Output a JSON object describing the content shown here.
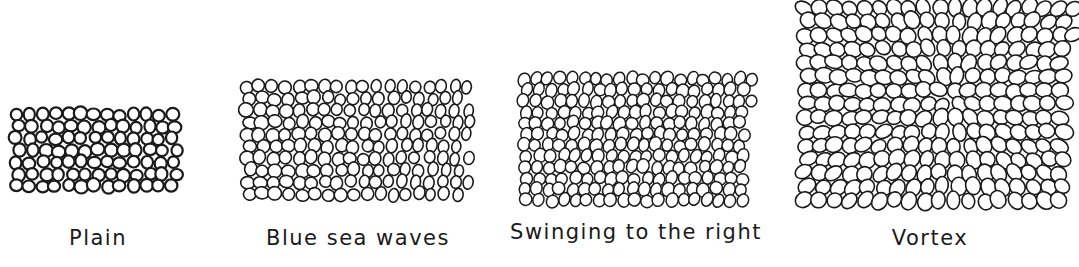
{
  "figure": {
    "panels": [
      {
        "id": "plain",
        "label": "Plain",
        "box": {
          "x": 10,
          "y": 108,
          "w": 175,
          "h": 88
        },
        "label_x": 98,
        "label_y": 226,
        "cell": 13,
        "stroke": 2.2,
        "style": "plain"
      },
      {
        "id": "blue-sea-waves",
        "label": "Blue sea waves",
        "box": {
          "x": 240,
          "y": 80,
          "w": 235,
          "h": 118
        },
        "label_x": 358,
        "label_y": 226,
        "cell": 13,
        "stroke": 1.6,
        "style": "waves"
      },
      {
        "id": "swinging-right",
        "label": "Swinging to the right",
        "box": {
          "x": 518,
          "y": 73,
          "w": 238,
          "h": 128
        },
        "label_x": 636,
        "label_y": 220,
        "cell": 12,
        "stroke": 1.5,
        "style": "swing"
      },
      {
        "id": "vortex",
        "label": "Vortex",
        "box": {
          "x": 797,
          "y": 0,
          "w": 282,
          "h": 210
        },
        "label_x": 930,
        "label_y": 226,
        "cell": 15,
        "stroke": 1.6,
        "style": "vortex"
      }
    ],
    "stroke_color": "#1a1a1a"
  }
}
